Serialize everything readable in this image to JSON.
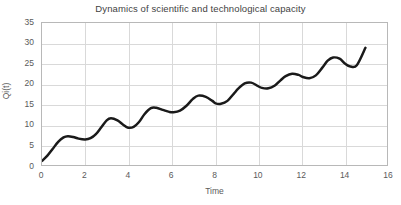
{
  "chart_data": {
    "type": "line",
    "title": "Dynamics of scientific and technological capacity",
    "xlabel": "Time",
    "ylabel": "Qi(t)",
    "xlim": [
      0,
      16
    ],
    "ylim": [
      0,
      35
    ],
    "xticks": [
      "0",
      "2",
      "4",
      "6",
      "8",
      "10",
      "12",
      "14",
      "16"
    ],
    "yticks": [
      "0",
      "5",
      "10",
      "15",
      "20",
      "25",
      "30",
      "35"
    ],
    "grid": true,
    "legend": null,
    "line_color": "#1a1a1a",
    "line_width": 2.5,
    "series": [
      {
        "name": "Qi(t)",
        "x": [
          0.0,
          0.25,
          0.5,
          0.75,
          1.0,
          1.2,
          1.45,
          1.7,
          2.0,
          2.25,
          2.5,
          2.75,
          3.0,
          3.2,
          3.5,
          3.75,
          4.0,
          4.25,
          4.5,
          4.75,
          5.05,
          5.3,
          5.6,
          5.9,
          6.1,
          6.4,
          6.7,
          7.0,
          7.25,
          7.6,
          7.9,
          8.05,
          8.3,
          8.6,
          8.9,
          9.1,
          9.4,
          9.7,
          10.0,
          10.2,
          10.5,
          10.8,
          11.05,
          11.3,
          11.6,
          11.9,
          12.1,
          12.4,
          12.7,
          13.0,
          13.25,
          13.5,
          13.8,
          14.05,
          14.3,
          14.6,
          15.0
        ],
        "y": [
          1.0,
          2.3,
          4.0,
          5.7,
          6.8,
          7.1,
          6.9,
          6.5,
          6.3,
          6.6,
          7.6,
          9.3,
          11.0,
          11.5,
          11.0,
          10.0,
          9.2,
          9.4,
          10.6,
          12.5,
          14.0,
          14.1,
          13.6,
          13.1,
          13.0,
          13.4,
          14.6,
          16.3,
          17.1,
          16.8,
          15.8,
          15.2,
          15.1,
          15.8,
          17.6,
          18.8,
          20.1,
          20.3,
          19.5,
          19.0,
          18.9,
          19.6,
          20.8,
          21.9,
          22.5,
          22.2,
          21.7,
          21.4,
          22.1,
          24.0,
          25.7,
          26.5,
          26.2,
          25.0,
          24.3,
          24.6,
          28.9
        ]
      }
    ],
    "key_points": {
      "start": {
        "x": 0,
        "y": 1.0
      },
      "end": {
        "x": 15,
        "y": 28.9
      },
      "local_maxima": [
        {
          "x": 1.2,
          "y": 7.1
        },
        {
          "x": 3.05,
          "y": 11.5
        },
        {
          "x": 5.1,
          "y": 14.1
        },
        {
          "x": 7.2,
          "y": 17.1
        },
        {
          "x": 9.15,
          "y": 20.3
        },
        {
          "x": 11.3,
          "y": 22.5
        },
        {
          "x": 13.4,
          "y": 26.5
        }
      ],
      "local_minima": [
        {
          "x": 2.05,
          "y": 6.3
        },
        {
          "x": 4.0,
          "y": 9.2
        },
        {
          "x": 6.1,
          "y": 13.0
        },
        {
          "x": 8.1,
          "y": 15.1
        },
        {
          "x": 10.2,
          "y": 18.9
        },
        {
          "x": 12.35,
          "y": 21.4
        },
        {
          "x": 14.3,
          "y": 24.3
        }
      ]
    }
  }
}
